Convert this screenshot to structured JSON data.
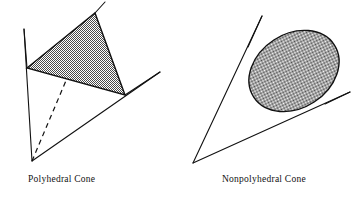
{
  "figure": {
    "title": "",
    "background_color": "#ffffff",
    "stroke_color": "#111111",
    "shade_color": "#808080",
    "panels": [
      {
        "id": "polyhedral",
        "caption": "Polyhedral Cone",
        "shape_type": "polyhedral-cone",
        "apex": [
          32,
          161
        ],
        "rays": [
          {
            "name": "left-ray",
            "from": [
              32,
              161
            ],
            "to": [
              24,
              29
            ],
            "style": "solid"
          },
          {
            "name": "back-ray",
            "from": [
              32,
              161
            ],
            "to": [
              95,
              12
            ],
            "style": "dashed"
          },
          {
            "name": "right-ray",
            "from": [
              32,
              161
            ],
            "to": [
              160,
              72
            ],
            "style": "solid"
          }
        ],
        "cross_section": {
          "name": "shaded-triangle",
          "vertices": [
            [
              27,
              68
            ],
            [
              95,
              13
            ],
            [
              125,
              95
            ]
          ],
          "fill": "checkerboard-50"
        }
      },
      {
        "id": "nonpolyhedral",
        "caption": "Nonpolyhedral Cone",
        "shape_type": "nonpolyhedral-cone",
        "apex": [
          193,
          163
        ],
        "rays": [
          {
            "name": "left-ray",
            "from": [
              193,
              163
            ],
            "to": [
              262,
              16
            ],
            "style": "solid"
          },
          {
            "name": "right-ray",
            "from": [
              193,
              163
            ],
            "to": [
              350,
              92
            ],
            "style": "solid"
          }
        ],
        "cross_section": {
          "name": "shaded-ellipse",
          "center": [
            294,
            71
          ],
          "radius_x": 48,
          "radius_y": 37,
          "rotation_deg": -33,
          "fill": "checkerboard-50"
        }
      }
    ]
  }
}
